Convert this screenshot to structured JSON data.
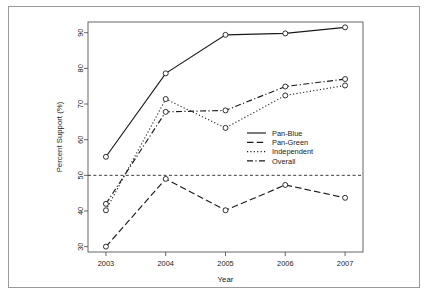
{
  "chart_data": {
    "type": "line",
    "title": "",
    "xlabel": "Year",
    "ylabel": "Percent Support (%)",
    "x": [
      2003,
      2004,
      2005,
      2006,
      2007
    ],
    "categories": [
      "2003",
      "2004",
      "2005",
      "2006",
      "2007"
    ],
    "xlim": [
      2002.7,
      2007.3
    ],
    "ylim": [
      28.5,
      93.0
    ],
    "xticks": [
      "2003",
      "2004",
      "2005",
      "2006",
      "2007"
    ],
    "yticks": [
      "30",
      "40",
      "50",
      "60",
      "70",
      "80",
      "90"
    ],
    "ytick_values": [
      30,
      40,
      50,
      60,
      70,
      80,
      90
    ],
    "grid": false,
    "legend_position": "center-right",
    "marker": "open-circle",
    "reference_line": {
      "value": 50,
      "style": "dashed",
      "label": ""
    },
    "series": [
      {
        "name": "Pan-Blue",
        "style": "solid",
        "values": [
          55.2,
          78.6,
          89.4,
          89.8,
          91.5
        ]
      },
      {
        "name": "Pan-Green",
        "style": "dashed",
        "values": [
          30.0,
          49.0,
          40.2,
          47.3,
          43.7
        ]
      },
      {
        "name": "Independent",
        "style": "dotted",
        "values": [
          40.2,
          71.4,
          63.3,
          72.4,
          75.2
        ]
      },
      {
        "name": "Overall",
        "style": "dashdot",
        "values": [
          42.0,
          67.8,
          68.2,
          74.9,
          77.0
        ]
      }
    ]
  },
  "legend": {
    "items": [
      {
        "label": "Pan-Blue"
      },
      {
        "label": "Pan-Green"
      },
      {
        "label": "Independent"
      },
      {
        "label": "Overall"
      }
    ]
  },
  "colors": {
    "line": "#1a1a1a",
    "axis": "#555555",
    "frame": "#9a9a9a",
    "background": "#ffffff"
  }
}
